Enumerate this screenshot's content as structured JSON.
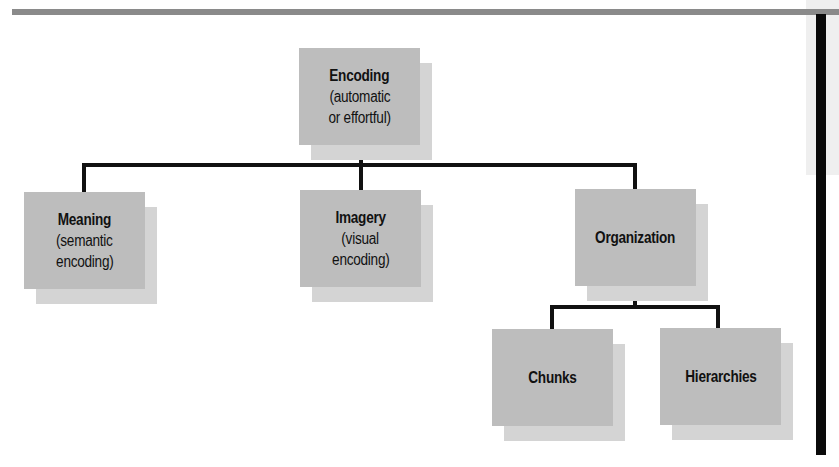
{
  "diagram": {
    "type": "hierarchy",
    "root": {
      "title": "Encoding",
      "subtitle_line1": "(automatic",
      "subtitle_line2": "or effortful)"
    },
    "children": [
      {
        "title": "Meaning",
        "subtitle_line1": "(semantic",
        "subtitle_line2": "encoding)"
      },
      {
        "title": "Imagery",
        "subtitle_line1": "(visual",
        "subtitle_line2": "encoding)"
      },
      {
        "title": "Organization"
      }
    ],
    "organization_children": [
      {
        "title": "Chunks"
      },
      {
        "title": "Hierarchies"
      }
    ],
    "colors": {
      "box_fill": "#bdbdbd",
      "box_shadow": "#d4d4d4",
      "connector": "#111111",
      "top_rule": "#8a8a8a",
      "side_rule": "#0a0a0a"
    }
  }
}
